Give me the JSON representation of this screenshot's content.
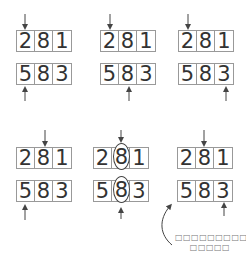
{
  "panels": [
    {
      "id": 1,
      "top": [
        "2",
        "8",
        "1"
      ],
      "bottom": [
        "5",
        "8",
        "3"
      ],
      "top_pointer": 0,
      "bottom_pointer": 0
    },
    {
      "id": 2,
      "top": [
        "2",
        "8",
        "1"
      ],
      "bottom": [
        "5",
        "8",
        "3"
      ],
      "top_pointer": 0,
      "bottom_pointer": 1
    },
    {
      "id": 3,
      "top": [
        "2",
        "8",
        "1"
      ],
      "bottom": [
        "5",
        "8",
        "3"
      ],
      "top_pointer": 0,
      "bottom_pointer": 2
    },
    {
      "id": 4,
      "top": [
        "2",
        "8",
        "1"
      ],
      "bottom": [
        "5",
        "8",
        "3"
      ],
      "top_pointer": 1,
      "bottom_pointer": 0
    },
    {
      "id": 5,
      "top": [
        "2",
        "8",
        "1"
      ],
      "bottom": [
        "5",
        "8",
        "3"
      ],
      "top_pointer": 1,
      "bottom_pointer": 1,
      "match": true
    },
    {
      "id": 6,
      "top": [
        "2",
        "8",
        "1"
      ],
      "bottom": [
        "5",
        "8",
        "3"
      ],
      "top_pointer": 1,
      "bottom_pointer": 2
    }
  ],
  "annotation": {
    "line1": "□□□□□□□□□□□",
    "line2": "□□□□□"
  },
  "colors": {
    "stroke": "#999999",
    "text": "#333333",
    "arrow": "#444444"
  }
}
